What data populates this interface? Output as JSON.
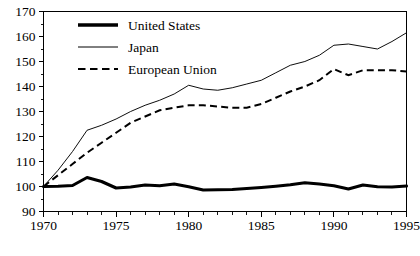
{
  "chart_data": {
    "type": "line",
    "title": "",
    "subtitle": "",
    "xlabel": "",
    "ylabel": "",
    "xlim": [
      1970,
      1995
    ],
    "ylim": [
      90,
      170
    ],
    "grid": false,
    "legend_position": "top-center",
    "y_ticks": [
      90,
      100,
      110,
      120,
      130,
      140,
      150,
      160,
      170
    ],
    "y_tick_labels": [
      "90",
      "100",
      "110",
      "120",
      "130",
      "140",
      "150",
      "160",
      "170"
    ],
    "y_minor_step": 5,
    "x_ticks": [
      1970,
      1975,
      1980,
      1985,
      1990,
      1995
    ],
    "x_tick_labels": [
      "1970",
      "1975",
      "1980",
      "1985",
      "1990",
      "1995"
    ],
    "x_minor_step": 1,
    "x": [
      1970,
      1971,
      1972,
      1973,
      1974,
      1975,
      1976,
      1977,
      1978,
      1979,
      1980,
      1981,
      1982,
      1983,
      1984,
      1985,
      1986,
      1987,
      1988,
      1989,
      1990,
      1991,
      1992,
      1993,
      1994,
      1995
    ],
    "series": [
      {
        "name": "United States",
        "style": "thick-solid",
        "color": "#000000",
        "values": [
          100.0,
          100.1,
          100.4,
          103.6,
          102.0,
          99.4,
          99.8,
          100.6,
          100.3,
          101.0,
          99.9,
          98.6,
          98.7,
          98.8,
          99.2,
          99.6,
          100.1,
          100.7,
          101.5,
          101.0,
          100.3,
          99.0,
          100.6,
          99.9,
          99.8,
          100.2
        ]
      },
      {
        "name": "Japan",
        "style": "thin-solid",
        "color": "#000000",
        "values": [
          100.0,
          106.5,
          114.0,
          122.5,
          124.5,
          127.0,
          130.0,
          132.5,
          134.5,
          137.0,
          140.5,
          139.0,
          138.5,
          139.5,
          141.0,
          142.5,
          145.5,
          148.5,
          150.0,
          152.5,
          156.5,
          157.0,
          156.0,
          155.0,
          158.0,
          161.5
        ]
      },
      {
        "name": "European Union",
        "style": "dashed",
        "color": "#000000",
        "values": [
          100.0,
          104.5,
          109.0,
          113.5,
          117.5,
          121.5,
          125.5,
          128.0,
          130.5,
          131.5,
          132.5,
          132.5,
          132.0,
          131.5,
          131.5,
          133.0,
          135.5,
          138.0,
          140.0,
          142.5,
          147.0,
          144.5,
          146.5,
          146.5,
          146.5,
          146.0
        ]
      }
    ]
  },
  "legend": {
    "items": [
      {
        "label": "United States",
        "style": "thick-solid"
      },
      {
        "label": "Japan",
        "style": "thin-solid"
      },
      {
        "label": "European Union",
        "style": "dashed"
      }
    ]
  }
}
